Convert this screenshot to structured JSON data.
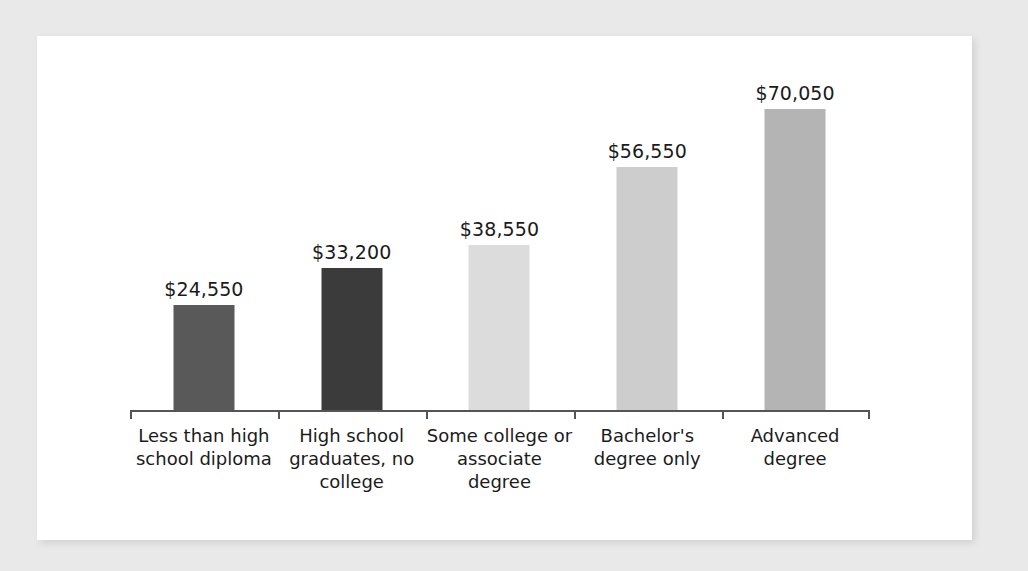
{
  "chart_data": {
    "type": "bar",
    "title": "",
    "subtitle": "",
    "xlabel": "",
    "ylabel": "",
    "ylim": [
      0,
      70050
    ],
    "grid": false,
    "legend": "none",
    "axis": {
      "baseline_visible": true,
      "ticks_visible": true,
      "y_axis_visible": false,
      "tick_labels": []
    },
    "categories": [
      "Less than high\nschool diploma",
      "High school\ngraduates, no\ncollege",
      "Some college or\nassociate\ndegree",
      "Bachelor's\ndegree only",
      "Advanced\ndegree"
    ],
    "values": [
      24550,
      33200,
      38550,
      56550,
      70050
    ],
    "value_labels": [
      "$24,550",
      "$33,200",
      "$38,550",
      "$56,550",
      "$70,050"
    ],
    "bar_colors": [
      "#595959",
      "#3b3b3b",
      "#dcdcdc",
      "#cdcdcd",
      "#b4b4b4"
    ]
  },
  "style": {
    "background_color": "#e9e9e9",
    "card_color": "#ffffff",
    "axis_color": "#555555",
    "text_color": "#1b1b1b"
  }
}
